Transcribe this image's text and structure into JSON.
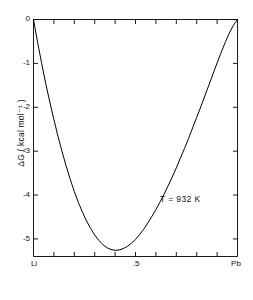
{
  "chart_data": {
    "type": "line",
    "title": "",
    "subtitle": "",
    "xlabel": "",
    "ylabel": "ΔG  ( kcal mol⁻¹ )",
    "xlim": [
      0,
      1
    ],
    "ylim": [
      -5.4,
      0
    ],
    "grid": false,
    "legend": null,
    "x_tick_labels": [
      {
        "value": 0,
        "label": "Li"
      },
      {
        "value": 0.5,
        "label": ".5"
      },
      {
        "value": 1,
        "label": "Pb"
      }
    ],
    "x_minor_ticks": [
      0.1,
      0.2,
      0.3,
      0.4,
      0.5,
      0.6,
      0.7,
      0.8,
      0.9
    ],
    "y_tick_labels": [
      {
        "value": 0,
        "label": "0"
      },
      {
        "value": -1,
        "label": "-1"
      },
      {
        "value": -2,
        "label": "-2"
      },
      {
        "value": -3,
        "label": "-3"
      },
      {
        "value": -4,
        "label": "-4"
      },
      {
        "value": -5,
        "label": "-5"
      }
    ],
    "annotations": [
      {
        "text": "T = 932 K",
        "x": 0.62,
        "y": -4.05
      }
    ],
    "series": [
      {
        "name": "ΔG mixing Li-Pb",
        "color": "#000000",
        "x": [
          0.0,
          0.02,
          0.04,
          0.06,
          0.08,
          0.1,
          0.12,
          0.14,
          0.16,
          0.18,
          0.2,
          0.22,
          0.24,
          0.26,
          0.28,
          0.3,
          0.32,
          0.34,
          0.36,
          0.38,
          0.4,
          0.42,
          0.44,
          0.46,
          0.48,
          0.5,
          0.52,
          0.54,
          0.56,
          0.58,
          0.6,
          0.62,
          0.64,
          0.66,
          0.68,
          0.7,
          0.72,
          0.74,
          0.76,
          0.78,
          0.8,
          0.82,
          0.84,
          0.86,
          0.88,
          0.9,
          0.92,
          0.94,
          0.96,
          0.98,
          1.0
        ],
        "y": [
          0.0,
          -0.52,
          -1.0,
          -1.46,
          -1.88,
          -2.28,
          -2.66,
          -3.01,
          -3.34,
          -3.64,
          -3.92,
          -4.17,
          -4.39,
          -4.59,
          -4.76,
          -4.91,
          -5.03,
          -5.13,
          -5.2,
          -5.24,
          -5.26,
          -5.25,
          -5.22,
          -5.17,
          -5.1,
          -5.01,
          -4.9,
          -4.78,
          -4.64,
          -4.49,
          -4.33,
          -4.16,
          -3.98,
          -3.79,
          -3.59,
          -3.38,
          -3.16,
          -2.94,
          -2.71,
          -2.47,
          -2.23,
          -1.99,
          -1.74,
          -1.49,
          -1.24,
          -0.99,
          -0.75,
          -0.52,
          -0.31,
          -0.13,
          0.0
        ]
      }
    ],
    "minimum": {
      "x": 0.4,
      "y": -5.26
    }
  },
  "axis": {
    "y_title": "ΔG  ( kcal mol⁻¹ )",
    "y_ticks": [
      "0",
      "-1",
      "-2",
      "-3",
      "-4",
      "-5"
    ],
    "x_ticks": [
      "Li",
      ".5",
      "Pb"
    ]
  },
  "annotation": {
    "temperature": "T = 932 K"
  },
  "colors": {
    "background": "#ffffff",
    "axis": "#000000",
    "curve": "#000000",
    "text": "#111111"
  }
}
